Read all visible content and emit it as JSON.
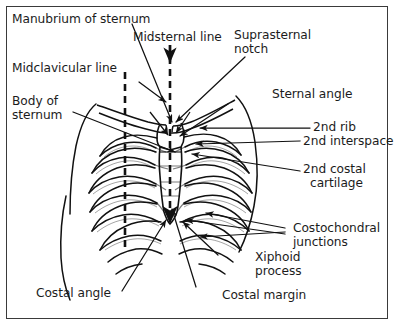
{
  "figure": {
    "type": "anatomical-diagram",
    "background_color": "#ffffff",
    "ink_color": "#1c1c1c",
    "border_color": "#3a3a3a"
  },
  "labels": {
    "manubrium": "Manubrium of sternum",
    "midsternal_line": "Midsternal line",
    "suprasternal_notch_l1": "Suprasternal",
    "suprasternal_notch_l2": "notch",
    "midclavicular_line": "Midclavicular line",
    "body_of_sternum_l1": "Body of",
    "body_of_sternum_l2": "sternum",
    "sternal_angle": "Sternal angle",
    "second_rib": "2nd rib",
    "second_interspace": "2nd interspace",
    "second_costal_cartilage_l1": "2nd costal",
    "second_costal_cartilage_l2": "cartilage",
    "costochondral_junctions_l1": "Costochondral",
    "costochondral_junctions_l2": "junctions",
    "xiphoid_process_l1": "Xiphoid",
    "xiphoid_process_l2": "process",
    "costal_angle": "Costal angle",
    "costal_margin": "Costal margin"
  },
  "reference_lines": [
    {
      "name": "midclavicular-line",
      "style": "dashed-vertical",
      "x": 125
    },
    {
      "name": "midsternal-line",
      "style": "dashed-vertical-with-arrowhead",
      "x": 170
    }
  ]
}
